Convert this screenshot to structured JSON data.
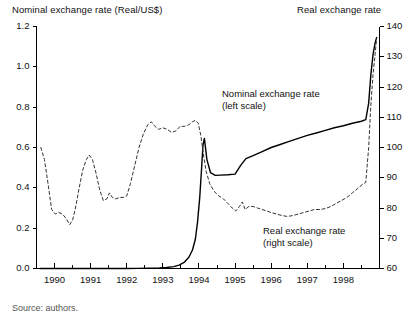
{
  "figure": {
    "left_axis_title": "Nominal exchange rate (Real/US$)",
    "right_axis_title": "Real exchange rate",
    "annotation_nominal_line1": "Nominal exchange rate",
    "annotation_nominal_line2": "(left scale)",
    "annotation_real_line1": "Real exchange rate",
    "annotation_real_line2": "(right scale)",
    "caption": "Source: authors."
  },
  "chart_data": {
    "type": "line",
    "title": "",
    "xlabel": "",
    "ylabel": "Nominal exchange rate (Real/US$)",
    "y2label": "Real exchange rate",
    "grid": false,
    "legend": "annotations-inline",
    "xlim": [
      1989.5,
      1999.0
    ],
    "xticks": [
      1990,
      1991,
      1992,
      1993,
      1994,
      1995,
      1996,
      1997,
      1998
    ],
    "xtick_labels": [
      "1990",
      "1991",
      "1992",
      "1993",
      "1994",
      "1995",
      "1996",
      "1997",
      "1998"
    ],
    "minor_xtick_interval": 0.5,
    "ylim": [
      0.0,
      1.2
    ],
    "yticks": [
      0.0,
      0.2,
      0.4,
      0.6,
      0.8,
      1.0,
      1.2
    ],
    "ytick_labels": [
      "0.0",
      "0.2",
      "0.4",
      "0.6",
      "0.8",
      "1.0",
      "1.2"
    ],
    "y2lim": [
      60,
      140
    ],
    "y2ticks": [
      60,
      70,
      80,
      90,
      100,
      110,
      120,
      130,
      140
    ],
    "y2tick_labels": [
      "60",
      "70",
      "80",
      "90",
      "100",
      "110",
      "120",
      "130",
      "140"
    ],
    "series": [
      {
        "name": "Nominal exchange rate (left scale)",
        "axis": "left",
        "style": "solid",
        "color": "#000000",
        "points": [
          [
            1989.6,
            0.0
          ],
          [
            1990.0,
            0.0
          ],
          [
            1990.5,
            0.0
          ],
          [
            1991.0,
            0.0
          ],
          [
            1991.5,
            0.0
          ],
          [
            1992.0,
            0.0
          ],
          [
            1992.3,
            0.0005
          ],
          [
            1992.6,
            0.0012
          ],
          [
            1992.9,
            0.0028
          ],
          [
            1993.1,
            0.005
          ],
          [
            1993.3,
            0.0095
          ],
          [
            1993.45,
            0.017
          ],
          [
            1993.6,
            0.032
          ],
          [
            1993.72,
            0.056
          ],
          [
            1993.82,
            0.092
          ],
          [
            1993.9,
            0.145
          ],
          [
            1993.96,
            0.23
          ],
          [
            1994.02,
            0.35
          ],
          [
            1994.07,
            0.49
          ],
          [
            1994.11,
            0.61
          ],
          [
            1994.15,
            0.645
          ],
          [
            1994.22,
            0.54
          ],
          [
            1994.32,
            0.475
          ],
          [
            1994.45,
            0.462
          ],
          [
            1994.6,
            0.463
          ],
          [
            1994.8,
            0.465
          ],
          [
            1995.0,
            0.468
          ],
          [
            1995.15,
            0.51
          ],
          [
            1995.3,
            0.545
          ],
          [
            1995.5,
            0.56
          ],
          [
            1995.75,
            0.58
          ],
          [
            1996.0,
            0.6
          ],
          [
            1996.25,
            0.615
          ],
          [
            1996.5,
            0.63
          ],
          [
            1996.75,
            0.645
          ],
          [
            1997.0,
            0.66
          ],
          [
            1997.25,
            0.672
          ],
          [
            1997.5,
            0.685
          ],
          [
            1997.75,
            0.698
          ],
          [
            1998.0,
            0.708
          ],
          [
            1998.25,
            0.72
          ],
          [
            1998.5,
            0.73
          ],
          [
            1998.62,
            0.738
          ],
          [
            1998.7,
            0.82
          ],
          [
            1998.76,
            0.96
          ],
          [
            1998.82,
            1.06
          ],
          [
            1998.88,
            1.12
          ],
          [
            1998.92,
            1.145
          ]
        ]
      },
      {
        "name": "Real exchange rate (right scale)",
        "axis": "right",
        "style": "dashed",
        "color": "#333333",
        "points": [
          [
            1989.62,
            100.0
          ],
          [
            1989.72,
            96.0
          ],
          [
            1989.82,
            88.0
          ],
          [
            1989.92,
            79.5
          ],
          [
            1990.02,
            78.0
          ],
          [
            1990.12,
            78.5
          ],
          [
            1990.22,
            78.0
          ],
          [
            1990.32,
            76.5
          ],
          [
            1990.42,
            74.5
          ],
          [
            1990.5,
            76.0
          ],
          [
            1990.58,
            80.0
          ],
          [
            1990.68,
            86.5
          ],
          [
            1990.78,
            92.5
          ],
          [
            1990.88,
            96.0
          ],
          [
            1990.96,
            97.5
          ],
          [
            1991.05,
            96.0
          ],
          [
            1991.15,
            91.5
          ],
          [
            1991.25,
            86.0
          ],
          [
            1991.35,
            82.5
          ],
          [
            1991.45,
            83.0
          ],
          [
            1991.52,
            85.0
          ],
          [
            1991.6,
            83.5
          ],
          [
            1991.7,
            83.0
          ],
          [
            1991.8,
            83.5
          ],
          [
            1991.9,
            83.5
          ],
          [
            1992.0,
            84.0
          ],
          [
            1992.1,
            88.0
          ],
          [
            1992.22,
            94.0
          ],
          [
            1992.34,
            100.0
          ],
          [
            1992.46,
            104.5
          ],
          [
            1992.58,
            107.5
          ],
          [
            1992.68,
            108.5
          ],
          [
            1992.78,
            107.0
          ],
          [
            1992.88,
            106.0
          ],
          [
            1993.0,
            106.5
          ],
          [
            1993.12,
            106.0
          ],
          [
            1993.24,
            105.0
          ],
          [
            1993.36,
            105.5
          ],
          [
            1993.48,
            107.0
          ],
          [
            1993.6,
            107.0
          ],
          [
            1993.72,
            107.5
          ],
          [
            1993.82,
            108.5
          ],
          [
            1993.9,
            109.0
          ],
          [
            1993.98,
            108.0
          ],
          [
            1994.05,
            104.0
          ],
          [
            1994.12,
            98.0
          ],
          [
            1994.2,
            92.0
          ],
          [
            1994.3,
            88.0
          ],
          [
            1994.42,
            85.5
          ],
          [
            1994.55,
            84.0
          ],
          [
            1994.68,
            83.0
          ],
          [
            1994.8,
            81.5
          ],
          [
            1994.92,
            80.0
          ],
          [
            1995.02,
            79.0
          ],
          [
            1995.12,
            80.5
          ],
          [
            1995.2,
            82.0
          ],
          [
            1995.28,
            79.5
          ],
          [
            1995.38,
            80.5
          ],
          [
            1995.5,
            80.5
          ],
          [
            1995.62,
            80.0
          ],
          [
            1995.75,
            79.5
          ],
          [
            1995.88,
            79.0
          ],
          [
            1996.0,
            78.5
          ],
          [
            1996.15,
            78.0
          ],
          [
            1996.3,
            77.5
          ],
          [
            1996.45,
            77.2
          ],
          [
            1996.6,
            77.5
          ],
          [
            1996.75,
            78.0
          ],
          [
            1996.9,
            78.5
          ],
          [
            1997.05,
            79.0
          ],
          [
            1997.2,
            79.5
          ],
          [
            1997.35,
            79.5
          ],
          [
            1997.5,
            79.8
          ],
          [
            1997.65,
            80.5
          ],
          [
            1997.8,
            81.5
          ],
          [
            1997.95,
            82.5
          ],
          [
            1998.1,
            83.5
          ],
          [
            1998.25,
            85.0
          ],
          [
            1998.4,
            86.5
          ],
          [
            1998.55,
            88.0
          ],
          [
            1998.62,
            88.5
          ],
          [
            1998.7,
            100.0
          ],
          [
            1998.76,
            114.0
          ],
          [
            1998.82,
            124.0
          ],
          [
            1998.88,
            131.0
          ],
          [
            1998.92,
            136.0
          ]
        ]
      }
    ]
  }
}
